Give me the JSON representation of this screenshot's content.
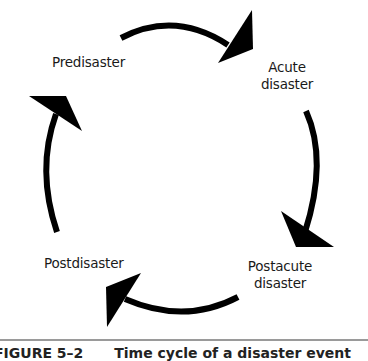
{
  "diagram": {
    "type": "cycle",
    "stages": [
      {
        "id": "predisaster",
        "label": "Predisaster"
      },
      {
        "id": "acute",
        "label_line1": "Acute",
        "label_line2": "disaster"
      },
      {
        "id": "postacute",
        "label_line1": "Postacute",
        "label_line2": "disaster"
      },
      {
        "id": "postdisaster",
        "label": "Postdisaster"
      }
    ],
    "arrow_color": "#000000"
  },
  "caption": {
    "figure_number": "FIGURE 5–2",
    "title": "Time cycle of a disaster event"
  }
}
